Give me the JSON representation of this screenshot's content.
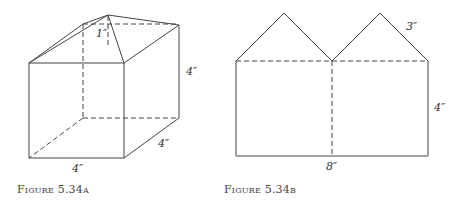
{
  "figure_a": {
    "caption": "Figure 5.34a",
    "labels": {
      "roof_height": "1″",
      "height": "4″",
      "depth": "4″",
      "width": "4″"
    }
  },
  "figure_b": {
    "caption": "Figure 5.34b",
    "labels": {
      "slant": "3″",
      "height": "4″",
      "length": "8″"
    }
  }
}
